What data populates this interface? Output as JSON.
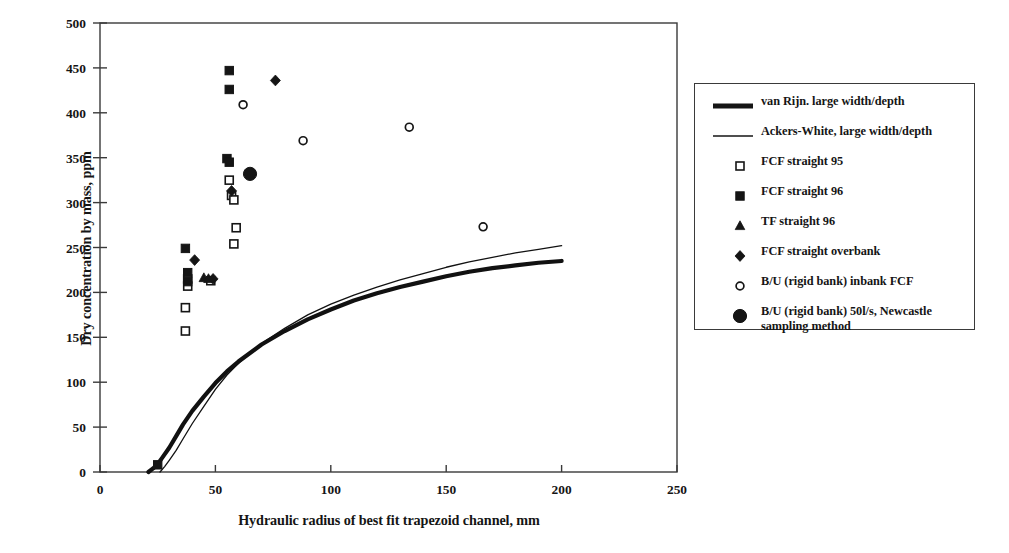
{
  "chart_data": {
    "type": "scatter",
    "title": "",
    "xlabel": "Hydraulic radius of best fit trapezoid channel, mm",
    "ylabel": "Dry concentration by mass, ppm",
    "xlim": [
      0,
      250
    ],
    "ylim": [
      0,
      500
    ],
    "xticks": [
      0,
      50,
      100,
      150,
      200,
      250
    ],
    "yticks": [
      0,
      50,
      100,
      150,
      200,
      250,
      300,
      350,
      400,
      450,
      500
    ],
    "xtick_labels": [
      "0",
      "50",
      "100",
      "150",
      "200",
      "250"
    ],
    "ytick_labels": [
      "0",
      "50",
      "100",
      "150",
      "200",
      "250",
      "300",
      "350",
      "400",
      "450",
      "500"
    ],
    "grid": false,
    "legend_position": "right-outside",
    "series": [
      {
        "name": "van Rijn. large width/depth",
        "marker": "thick-line",
        "type": "line",
        "linewidth": 4.2,
        "color": "#111111",
        "points": [
          [
            21,
            0
          ],
          [
            23,
            4
          ],
          [
            25,
            9
          ],
          [
            27,
            16
          ],
          [
            30,
            27
          ],
          [
            33,
            40
          ],
          [
            36,
            53
          ],
          [
            40,
            68
          ],
          [
            45,
            84
          ],
          [
            50,
            99
          ],
          [
            55,
            112
          ],
          [
            60,
            123
          ],
          [
            70,
            142
          ],
          [
            80,
            157
          ],
          [
            90,
            170
          ],
          [
            100,
            181
          ],
          [
            110,
            191
          ],
          [
            120,
            199
          ],
          [
            130,
            206
          ],
          [
            140,
            212
          ],
          [
            150,
            218
          ],
          [
            160,
            223
          ],
          [
            170,
            227
          ],
          [
            180,
            230
          ],
          [
            190,
            233
          ],
          [
            200,
            235
          ]
        ]
      },
      {
        "name": "Ackers-White, large width/depth",
        "marker": "thin-line",
        "type": "line",
        "linewidth": 1.3,
        "color": "#111111",
        "points": [
          [
            26,
            0
          ],
          [
            28,
            6
          ],
          [
            30,
            13
          ],
          [
            33,
            24
          ],
          [
            36,
            37
          ],
          [
            40,
            54
          ],
          [
            45,
            73
          ],
          [
            50,
            92
          ],
          [
            55,
            108
          ],
          [
            60,
            121
          ],
          [
            70,
            143
          ],
          [
            80,
            160
          ],
          [
            90,
            175
          ],
          [
            100,
            187
          ],
          [
            110,
            197
          ],
          [
            120,
            206
          ],
          [
            130,
            214
          ],
          [
            140,
            221
          ],
          [
            150,
            228
          ],
          [
            160,
            234
          ],
          [
            170,
            239
          ],
          [
            180,
            244
          ],
          [
            190,
            248
          ],
          [
            200,
            252
          ]
        ]
      },
      {
        "name": "FCF straight 95",
        "marker": "open-square",
        "type": "scatter",
        "points": [
          [
            37,
            157
          ],
          [
            37,
            183
          ],
          [
            38,
            207
          ],
          [
            38,
            215
          ],
          [
            48,
            213
          ],
          [
            56,
            325
          ],
          [
            57,
            308
          ],
          [
            58,
            303
          ],
          [
            59,
            272
          ],
          [
            58,
            254
          ]
        ]
      },
      {
        "name": "FCF straight 96",
        "marker": "filled-square",
        "type": "scatter",
        "points": [
          [
            25,
            8
          ],
          [
            37,
            249
          ],
          [
            38,
            222
          ],
          [
            38,
            212
          ],
          [
            56,
            447
          ],
          [
            56,
            426
          ],
          [
            55,
            349
          ],
          [
            56,
            345
          ]
        ]
      },
      {
        "name": "TF straight 96",
        "marker": "filled-triangle",
        "type": "scatter",
        "points": [
          [
            45,
            216
          ],
          [
            47,
            215
          ]
        ]
      },
      {
        "name": "FCF straight overbank",
        "marker": "filled-diamond",
        "type": "scatter",
        "points": [
          [
            41,
            236
          ],
          [
            49,
            215
          ],
          [
            57,
            313
          ],
          [
            76,
            436
          ]
        ]
      },
      {
        "name": "B/U (rigid bank) inbank FCF",
        "marker": "open-circle",
        "type": "scatter",
        "points": [
          [
            62,
            409
          ],
          [
            88,
            369
          ],
          [
            134,
            384
          ],
          [
            166,
            273
          ]
        ]
      },
      {
        "name": "B/U (rigid bank) 50l/s, Newcastle sampling method",
        "marker": "filled-circle",
        "type": "scatter",
        "points": [
          [
            65,
            332
          ]
        ]
      }
    ]
  },
  "legend": {
    "items": [
      {
        "label": "van Rijn. large width/depth",
        "marker": "thick-line"
      },
      {
        "label": "Ackers-White, large width/depth",
        "marker": "thin-line"
      },
      {
        "label": "FCF straight 95",
        "marker": "open-square"
      },
      {
        "label": "FCF straight 96",
        "marker": "filled-square"
      },
      {
        "label": "TF straight 96",
        "marker": "filled-triangle"
      },
      {
        "label": "FCF straight overbank",
        "marker": "filled-diamond"
      },
      {
        "label": "B/U (rigid bank) inbank FCF",
        "marker": "open-circle"
      },
      {
        "label": "B/U (rigid bank) 50l/s, Newcastle sampling method",
        "marker": "filled-circle"
      }
    ]
  },
  "colors": {
    "ink": "#151515",
    "frame": "#3a3a3a",
    "background": "#ffffff"
  }
}
